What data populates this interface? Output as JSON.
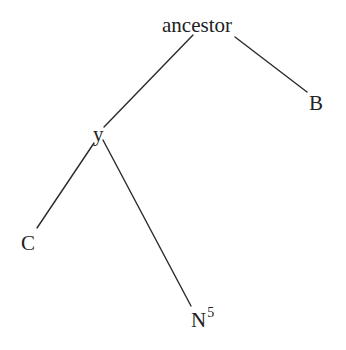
{
  "diagram": {
    "type": "tree",
    "nodes": [
      {
        "id": "ancestor",
        "label": "ancestor",
        "superscript": ""
      },
      {
        "id": "y",
        "label": "y",
        "superscript": ""
      },
      {
        "id": "B",
        "label": "B",
        "superscript": ""
      },
      {
        "id": "C",
        "label": "C",
        "superscript": ""
      },
      {
        "id": "N",
        "label": "N",
        "superscript": "5"
      }
    ],
    "edges": [
      {
        "from": "ancestor",
        "to": "y"
      },
      {
        "from": "ancestor",
        "to": "B"
      },
      {
        "from": "y",
        "to": "C"
      },
      {
        "from": "y",
        "to": "N"
      }
    ]
  },
  "colors": {
    "text": "#222222",
    "edge": "#2a2a2a",
    "background": "#ffffff"
  }
}
